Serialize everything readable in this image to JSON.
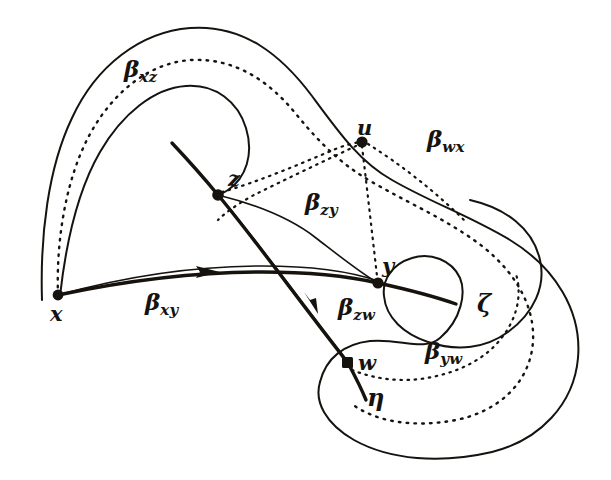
{
  "figure": {
    "kind": "mathematical-diagram",
    "background_color": "#ffffff",
    "ink_color": "#16130f",
    "width": 611,
    "height": 480
  },
  "points": [
    {
      "id": "x",
      "label": "x",
      "x": 58,
      "y": 295,
      "label_x": 50,
      "label_y": 303
    },
    {
      "id": "z",
      "label": "z",
      "x": 218,
      "y": 195,
      "label_x": 228,
      "label_y": 168
    },
    {
      "id": "u",
      "label": "u",
      "x": 362,
      "y": 142,
      "label_x": 357,
      "label_y": 117
    },
    {
      "id": "y",
      "label": "y",
      "x": 378,
      "y": 283,
      "label_x": 382,
      "label_y": 255
    },
    {
      "id": "w",
      "label": "w",
      "x": 348,
      "y": 363,
      "label_x": 358,
      "label_y": 352
    }
  ],
  "ray_labels": [
    {
      "id": "zeta",
      "label": "ζ",
      "label_x": 477,
      "label_y": 295
    },
    {
      "id": "eta",
      "label": "η",
      "label_x": 367,
      "label_y": 389
    }
  ],
  "geodesic_labels": [
    {
      "id": "beta_xz",
      "beta": "β",
      "sub": "xz",
      "label_x": 124,
      "label_y": 57
    },
    {
      "id": "beta_wx",
      "beta": "β",
      "sub": "wx",
      "label_x": 427,
      "label_y": 127
    },
    {
      "id": "beta_zy",
      "beta": "β",
      "sub": "zy",
      "label_x": 305,
      "label_y": 190
    },
    {
      "id": "beta_xy",
      "beta": "β",
      "sub": "xy",
      "label_x": 145,
      "label_y": 290
    },
    {
      "id": "beta_zw",
      "beta": "β",
      "sub": "zw",
      "label_x": 338,
      "label_y": 295
    },
    {
      "id": "beta_yw",
      "beta": "β",
      "sub": "yw",
      "label_x": 425,
      "label_y": 339
    }
  ],
  "paths": {
    "outer_boundary": "M 42 300 C 40 236 48 168 72 118 C 96 66 140 32 190 28 C 244 24 282 56 312 96 C 340 134 360 162 392 180 C 430 202 470 216 510 240 C 556 268 582 312 578 358 C 574 404 540 440 492 452 C 440 464 390 460 354 440 C 326 424 314 402 320 382",
    "inner_pocket": "M 320 382 C 326 358 344 344 370 341 C 400 338 424 352 440 338 C 462 319 466 292 460 278 C 452 260 430 252 412 258 C 392 264 382 280 384 296 C 386 318 404 334 428 342 C 458 352 486 348 508 332 C 534 313 546 286 540 260 C 533 228 505 208 470 200",
    "dotted_outer": "M 58 295 C 56 240 66 178 90 134 C 113 92 150 62 192 60 C 236 58 270 82 296 114 C 322 146 344 166 372 182 C 410 204 448 220 482 246 C 520 276 538 314 532 350 C 526 386 496 412 456 420 C 414 428 376 422 352 404",
    "dotted_w_to_boundary": "M 352 370 C 372 378 396 382 420 379 C 452 375 482 362 500 340 C 518 318 522 294 516 274",
    "inner_solid_loop": "M 60 296 C 66 242 78 190 100 152 C 122 114 154 88 186 86 C 216 84 238 102 246 128 C 254 154 246 178 228 190 C 222 194 218 195 218 195",
    "geodesic_x_to_y": "M 58 295 C 120 282 190 272 262 272 C 312 272 352 277 378 283",
    "geodesic_y_to_zeta": "M 378 283 C 410 290 436 297 456 304",
    "geodesic_z_to_w": "M 218 195 C 254 238 300 302 348 363",
    "geodesic_w_to_eta": "M 348 363 C 356 378 362 390 366 400",
    "geodesic_z_upper": "M 218 195 C 204 178 188 160 172 143",
    "curve_z_to_y": "M 218 195 C 254 204 288 216 316 238 C 342 258 362 274 378 283",
    "dotted_z_to_u": "M 222 192 C 258 182 300 164 338 148 C 346 145 354 143 360 142",
    "dotted_u_to_y": "M 362 146 C 366 180 372 232 377 276",
    "dotted_u_left_lower": "M 356 146 C 322 162 284 180 252 196 C 238 204 226 212 218 220",
    "dotted_u_right": "M 368 144 C 400 164 436 192 466 222"
  },
  "arrows": [
    {
      "id": "arrow-xy",
      "x": 196,
      "y": 272,
      "angle": -8,
      "note": "arrowhead on beta_xy pointing toward y"
    },
    {
      "id": "arrow-zw",
      "x": 314,
      "y": 309,
      "angle": 54,
      "note": "arrowhead on beta_zw pointing toward w"
    }
  ]
}
